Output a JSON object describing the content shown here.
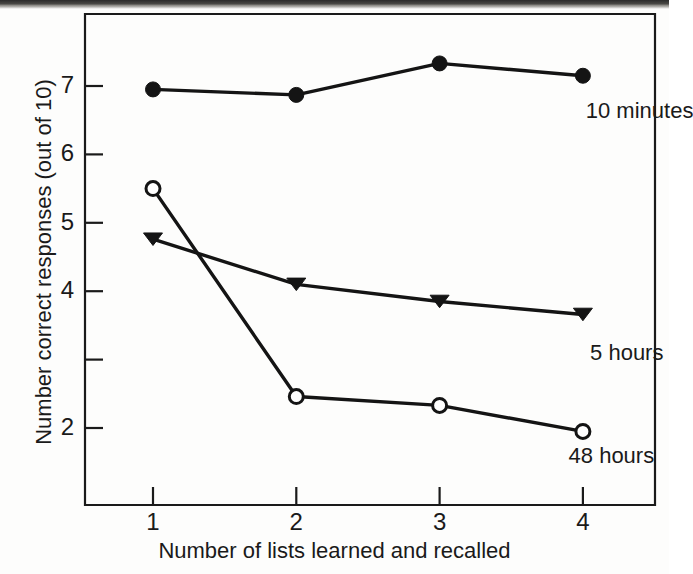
{
  "figure": {
    "background_color": "#fdfdfc",
    "ink_color": "#141414"
  },
  "chart_data": {
    "type": "line",
    "title": "",
    "subtitle": "",
    "xlabel": "Number of lists learned and recalled",
    "ylabel": "Number correct responses (out of 10)",
    "x": [
      1,
      2,
      3,
      4
    ],
    "categories": [
      "1",
      "2",
      "3",
      "4"
    ],
    "xtick_labels": [
      "1",
      "2",
      "3",
      "4"
    ],
    "ytick_labels": [
      "7",
      "6",
      "5",
      "4",
      "",
      "2"
    ],
    "ytick_values": [
      7,
      6,
      5,
      4,
      3,
      2
    ],
    "xlim": [
      0.6,
      4.45
    ],
    "ylim": [
      1.25,
      7.85
    ],
    "grid": false,
    "legend_position": "inline-right-of-series",
    "series": [
      {
        "name": "10 minutes",
        "label": "10 minutes",
        "marker": "filled-circle",
        "color": "#141414",
        "values": [
          6.95,
          6.87,
          7.33,
          7.15
        ],
        "label_x": 4.02,
        "label_y": 6.66
      },
      {
        "name": "5 hours",
        "label": "5 hours",
        "marker": "filled-triangle-down",
        "color": "#141414",
        "values": [
          4.76,
          4.1,
          3.85,
          3.66
        ],
        "label_x": 4.05,
        "label_y": 3.12
      },
      {
        "name": "48 hours",
        "label": "48 hours",
        "marker": "open-circle",
        "color": "#141414",
        "values": [
          5.5,
          2.46,
          2.33,
          1.95
        ],
        "label_x": 3.9,
        "label_y": 1.62
      }
    ]
  }
}
